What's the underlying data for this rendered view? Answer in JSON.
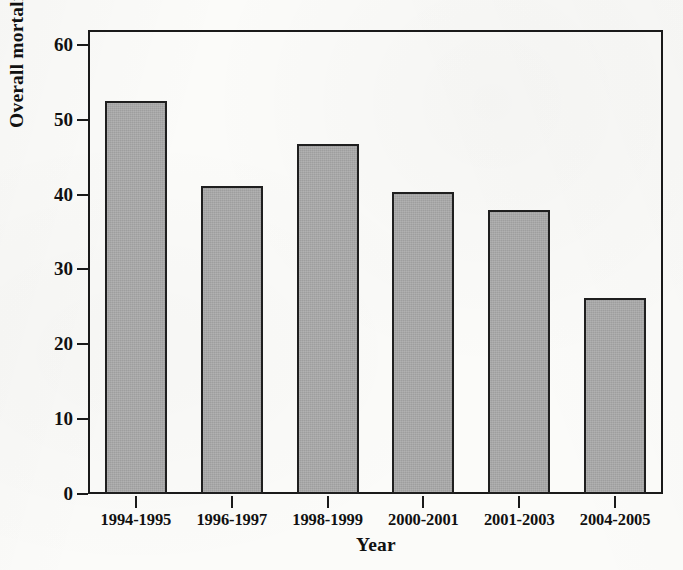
{
  "chart_data": {
    "type": "bar",
    "title": "",
    "xlabel": "Year",
    "ylabel": "Overall mortality, %",
    "categories": [
      "1994-1995",
      "1996-1997",
      "1998-1999",
      "2000-2001",
      "2001-2003",
      "2004-2005"
    ],
    "values": [
      52.5,
      41.2,
      46.8,
      40.4,
      38.0,
      26.2
    ],
    "ylim": [
      0,
      62
    ],
    "yticks": [
      0,
      10,
      20,
      30,
      40,
      50,
      60
    ],
    "ytick_labels": [
      "0",
      "10",
      "20",
      "30",
      "40",
      "50",
      "60"
    ],
    "grid": false,
    "legend": null,
    "bar_fill_color": "#a9a9a9",
    "bar_edge_color": "#1f1f1f",
    "axis_color": "#1a1a1a",
    "background_color": "#fbfbf9"
  }
}
